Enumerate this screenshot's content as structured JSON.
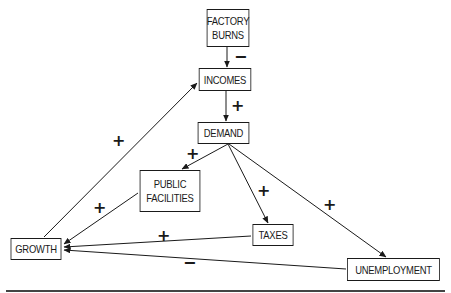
{
  "diagram": {
    "type": "causal-loop",
    "nodes": {
      "factory_burns": {
        "lines": [
          "FACTORY",
          "BURNS"
        ]
      },
      "incomes": {
        "label": "INCOMES"
      },
      "demand": {
        "label": "DEMAND"
      },
      "public_facilities": {
        "lines": [
          "PUBLIC",
          "FACILITIES"
        ]
      },
      "taxes": {
        "label": "TAXES"
      },
      "growth": {
        "label": "GROWTH"
      },
      "unemployment": {
        "label": "UNEMPLOYMENT"
      }
    },
    "edges": [
      {
        "from": "FACTORY BURNS",
        "to": "INCOMES",
        "sign": "−"
      },
      {
        "from": "INCOMES",
        "to": "DEMAND",
        "sign": "+"
      },
      {
        "from": "DEMAND",
        "to": "PUBLIC FACILITIES",
        "sign": "+"
      },
      {
        "from": "DEMAND",
        "to": "TAXES",
        "sign": "+"
      },
      {
        "from": "DEMAND",
        "to": "UNEMPLOYMENT",
        "sign": "+"
      },
      {
        "from": "PUBLIC FACILITIES",
        "to": "GROWTH",
        "sign": "+"
      },
      {
        "from": "TAXES",
        "to": "GROWTH",
        "sign": "+"
      },
      {
        "from": "UNEMPLOYMENT",
        "to": "GROWTH",
        "sign": "−"
      },
      {
        "from": "GROWTH",
        "to": "INCOMES",
        "sign": "+"
      }
    ],
    "signs": {
      "burns_incomes": "−",
      "incomes_demand": "+",
      "demand_public": "+",
      "demand_taxes": "+",
      "demand_unemployment": "+",
      "public_growth": "+",
      "taxes_growth": "+",
      "unemployment_growth": "−",
      "growth_incomes": "+"
    }
  }
}
